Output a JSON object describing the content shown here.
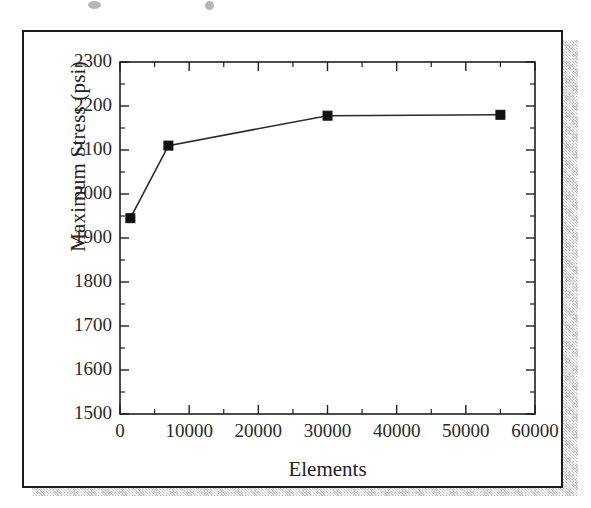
{
  "figure": {
    "caption_fragment_visible": "",
    "border_color": "#1c1c1c",
    "shadow_color": "#b9b9b9",
    "background_color": "#ffffff"
  },
  "chart_data": {
    "type": "line",
    "title": "",
    "subtitle": "",
    "xlabel": "Elements",
    "ylabel": "Maximum Stress (psi)",
    "xlim": [
      0,
      60000
    ],
    "ylim": [
      1500,
      2300
    ],
    "xticks": [
      0,
      10000,
      20000,
      30000,
      40000,
      50000,
      60000
    ],
    "xtick_labels": [
      "0",
      "10000",
      "20000",
      "30000",
      "40000",
      "50000",
      "60000"
    ],
    "yticks": [
      1500,
      1600,
      1700,
      1800,
      1900,
      2000,
      2100,
      2200,
      2300
    ],
    "ytick_labels": [
      "1500",
      "1600",
      "1700",
      "1800",
      "1900",
      "2000",
      "2100",
      "2200",
      "2300"
    ],
    "x_minor_tick_step": 5000,
    "y_minor_tick_step": 50,
    "grid": false,
    "legend": null,
    "series": [
      {
        "name": "Maximum Stress",
        "marker": "square",
        "marker_color": "#111111",
        "line_color": "#2b2b2b",
        "x": [
          1500,
          7000,
          30000,
          55000
        ],
        "y": [
          1945,
          2110,
          2178,
          2180
        ]
      }
    ],
    "annotations": []
  }
}
